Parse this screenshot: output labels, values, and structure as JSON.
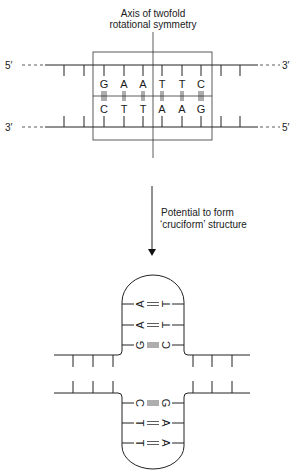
{
  "diagram": {
    "axis_label_line1": "Axis of twofold",
    "axis_label_line2": "rotational symmetry",
    "top_strand": {
      "left_end": "5′",
      "right_end": "3′",
      "bases": [
        "G",
        "A",
        "A",
        "T",
        "T",
        "C"
      ]
    },
    "bottom_strand": {
      "left_end": "3′",
      "right_end": "5′",
      "bases": [
        "C",
        "T",
        "T",
        "A",
        "A",
        "G"
      ]
    },
    "bonds": [
      "|||",
      "||",
      "||",
      "||",
      "||",
      "|||"
    ],
    "arrow_label_line1": "Potential to form",
    "arrow_label_line2": "‘cruciform’ structure",
    "cruciform": {
      "upper_loop_pairs": [
        {
          "left": "A",
          "bond": "||",
          "right": "T"
        },
        {
          "left": "A",
          "bond": "||",
          "right": "T"
        },
        {
          "left": "G",
          "bond": "|||",
          "right": "C"
        }
      ],
      "lower_loop_pairs": [
        {
          "left": "C",
          "bond": "|||",
          "right": "G"
        },
        {
          "left": "T",
          "bond": "||",
          "right": "A"
        },
        {
          "left": "T",
          "bond": "||",
          "right": "A"
        }
      ]
    }
  }
}
